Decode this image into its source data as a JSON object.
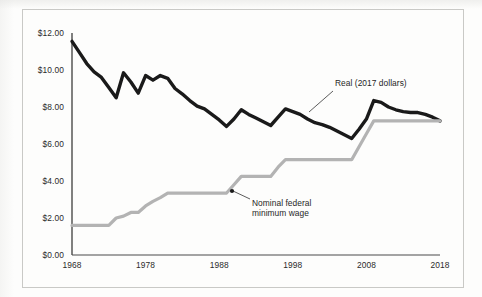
{
  "chart_data": {
    "type": "line",
    "title": "",
    "subtitle": "",
    "xlabel": "",
    "ylabel": "",
    "xlim": [
      1968,
      2018
    ],
    "ylim": [
      0,
      12
    ],
    "grid": false,
    "legend_position": "inline-annotations",
    "x_tick_labels": [
      "1968",
      "1978",
      "1988",
      "1998",
      "2008",
      "2018"
    ],
    "x_ticks": [
      1968,
      1978,
      1988,
      1998,
      2008,
      2018
    ],
    "y_tick_labels": [
      "$0.00",
      "$2.00",
      "$4.00",
      "$6.00",
      "$8.00",
      "$10.00",
      "$12.00"
    ],
    "y_ticks": [
      0,
      2,
      4,
      6,
      8,
      10,
      12
    ],
    "series": [
      {
        "name": "Real (2017 dollars)",
        "color": "#1a1a1a",
        "x": [
          1968,
          1969,
          1970,
          1971,
          1972,
          1973,
          1974,
          1975,
          1976,
          1977,
          1978,
          1979,
          1980,
          1981,
          1982,
          1983,
          1984,
          1985,
          1986,
          1987,
          1988,
          1989,
          1990,
          1991,
          1992,
          1993,
          1994,
          1995,
          1996,
          1997,
          1998,
          1999,
          2000,
          2001,
          2002,
          2003,
          2004,
          2005,
          2006,
          2007,
          2008,
          2009,
          2010,
          2011,
          2012,
          2013,
          2014,
          2015,
          2016,
          2017,
          2018
        ],
        "values": [
          11.55,
          10.95,
          10.35,
          9.9,
          9.6,
          9.05,
          8.5,
          9.85,
          9.35,
          8.75,
          9.7,
          9.45,
          9.7,
          9.55,
          9.0,
          8.7,
          8.35,
          8.05,
          7.9,
          7.6,
          7.3,
          6.95,
          7.35,
          7.85,
          7.6,
          7.4,
          7.2,
          7.0,
          7.45,
          7.9,
          7.75,
          7.6,
          7.35,
          7.15,
          7.05,
          6.9,
          6.7,
          6.5,
          6.3,
          6.8,
          7.35,
          8.35,
          8.25,
          8.0,
          7.85,
          7.75,
          7.7,
          7.7,
          7.6,
          7.45,
          7.25
        ]
      },
      {
        "name": "Nominal federal minimum wage",
        "color": "#b3b3b3",
        "x": [
          1968,
          1969,
          1970,
          1971,
          1972,
          1973,
          1974,
          1975,
          1976,
          1977,
          1978,
          1979,
          1980,
          1981,
          1982,
          1983,
          1984,
          1985,
          1986,
          1987,
          1988,
          1989,
          1990,
          1991,
          1992,
          1993,
          1994,
          1995,
          1996,
          1997,
          1998,
          1999,
          2000,
          2001,
          2002,
          2003,
          2004,
          2005,
          2006,
          2007,
          2008,
          2009,
          2010,
          2011,
          2012,
          2013,
          2014,
          2015,
          2016,
          2017,
          2018
        ],
        "values": [
          1.6,
          1.6,
          1.6,
          1.6,
          1.6,
          1.6,
          2.0,
          2.1,
          2.3,
          2.3,
          2.65,
          2.9,
          3.1,
          3.35,
          3.35,
          3.35,
          3.35,
          3.35,
          3.35,
          3.35,
          3.35,
          3.35,
          3.8,
          4.25,
          4.25,
          4.25,
          4.25,
          4.25,
          4.75,
          5.15,
          5.15,
          5.15,
          5.15,
          5.15,
          5.15,
          5.15,
          5.15,
          5.15,
          5.15,
          5.85,
          6.55,
          7.25,
          7.25,
          7.25,
          7.25,
          7.25,
          7.25,
          7.25,
          7.25,
          7.25,
          7.25
        ]
      }
    ],
    "annotations": [
      {
        "name": "real-series-callout",
        "text": "Real (2017 dollars)",
        "text_x": 335,
        "text_y": 78,
        "leader_from": [
          333,
          91
        ],
        "leader_to": [
          309,
          112
        ],
        "marker": false
      },
      {
        "name": "nominal-series-callout",
        "text_line1": "Nominal federal",
        "text_line2": "minimum wage",
        "text_x": 252,
        "text_y": 198,
        "leader_from": [
          250,
          199
        ],
        "leader_to": [
          233,
          191
        ],
        "marker": true,
        "marker_x": 232,
        "marker_y": 191
      }
    ]
  },
  "colors": {
    "real_line": "#1a1a1a",
    "nominal_line": "#b3b3b3",
    "axis": "#4a4a4a",
    "frame": "#c9c9c6",
    "text": "#2b2b2b",
    "background": "#fdfdfc"
  },
  "geometry": {
    "plot_left": 72,
    "plot_right": 440,
    "plot_top": 33,
    "plot_bottom": 255
  }
}
